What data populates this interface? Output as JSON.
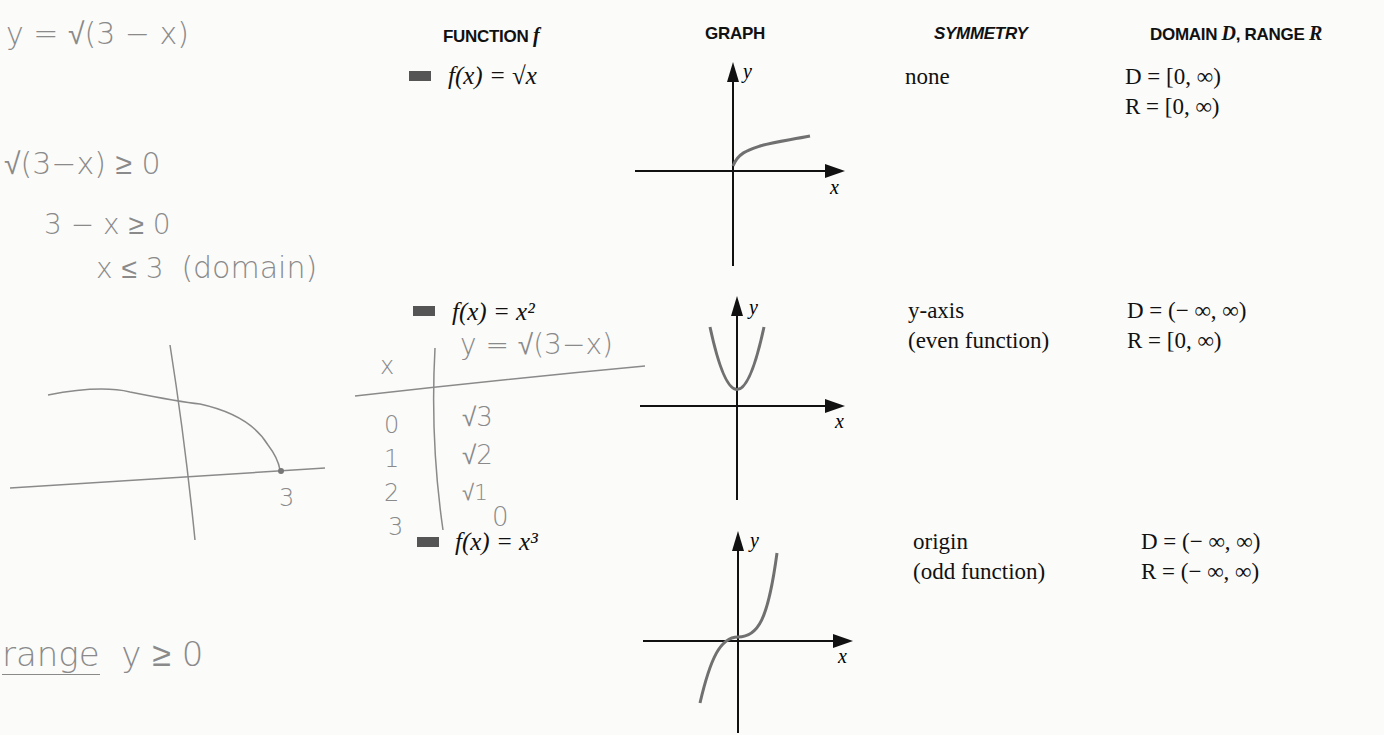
{
  "headers": {
    "function": "FUNCTION",
    "function_var": "f",
    "graph": "GRAPH",
    "symmetry": "SYMMETRY",
    "domain_range_a": "DOMAIN",
    "domain_var": "D",
    "domain_range_b": ", RANGE",
    "range_var": "R"
  },
  "rows": [
    {
      "function": "f(x) = √x",
      "graph": "square-root-curve",
      "symmetry_line1": "none",
      "symmetry_line2": "",
      "domain": "D = [0, ∞)",
      "range": "R = [0, ∞)"
    },
    {
      "function": "f(x) = x²",
      "graph": "parabola",
      "symmetry_line1": "y-axis",
      "symmetry_line2": "(even function)",
      "domain": "D = (− ∞, ∞)",
      "range": "R = [0, ∞)"
    },
    {
      "function": "f(x) = x³",
      "graph": "cubic-curve",
      "symmetry_line1": "origin",
      "symmetry_line2": "(odd function)",
      "domain": "D = (− ∞, ∞)",
      "range": "R = (− ∞, ∞)"
    }
  ],
  "axis_labels": {
    "x": "x",
    "y": "y"
  },
  "handwritten": {
    "equation": "y = √(3 − x)",
    "step1": "√(3−x)  ≥ 0",
    "step2": "3 − x  ≥ 0",
    "step3": "x  ≤ 3",
    "step3_note": "(domain)",
    "table_header_x": "x",
    "table_header_y": "y = √(3−x)",
    "table_x": [
      "0",
      "1",
      "2",
      "3"
    ],
    "table_y": [
      "√3",
      "√2",
      "√1",
      "0"
    ],
    "sketch_label": "3",
    "range_word": "range",
    "range_expr": "y  ≥ 0"
  }
}
